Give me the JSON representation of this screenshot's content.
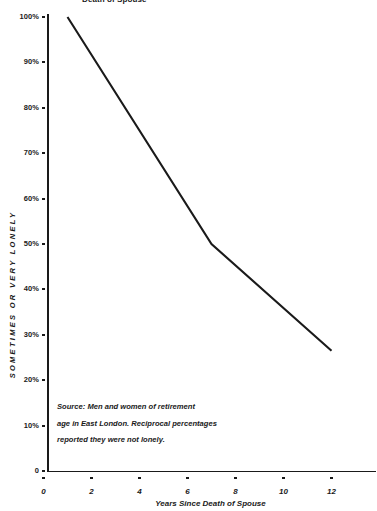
{
  "chart_data": {
    "type": "line",
    "title": "Death of Spouse",
    "xlabel": "Years Since Death of Spouse",
    "ylabel": "SOMETIMES OR VERY LONELY",
    "x": [
      1,
      7,
      12
    ],
    "values": [
      100,
      50,
      26.5
    ],
    "series": [
      {
        "name": "Sometimes or very lonely",
        "x": [
          1,
          7,
          12
        ],
        "values": [
          100,
          50,
          26.5
        ]
      }
    ],
    "xlim": [
      0,
      13.7
    ],
    "ylim": [
      0,
      100
    ],
    "xticks": [
      0,
      2,
      4,
      6,
      8,
      10,
      12
    ],
    "xtick_labels": [
      "0",
      "2",
      "4",
      "6",
      "8",
      "10",
      "12"
    ],
    "yticks": [
      0,
      10,
      20,
      30,
      40,
      50,
      60,
      70,
      80,
      90,
      100
    ],
    "ytick_labels": [
      "0",
      "10%",
      "20%",
      "30%",
      "40%",
      "50%",
      "60%",
      "70%",
      "80%",
      "90%",
      "100%"
    ],
    "grid": false,
    "legend": "none",
    "line_color": "#1a1a1a",
    "annotations": [
      "Source: Men and women of retirement",
      "age  in East London. Reciprocal percentages",
      "reported they were not lonely."
    ]
  }
}
